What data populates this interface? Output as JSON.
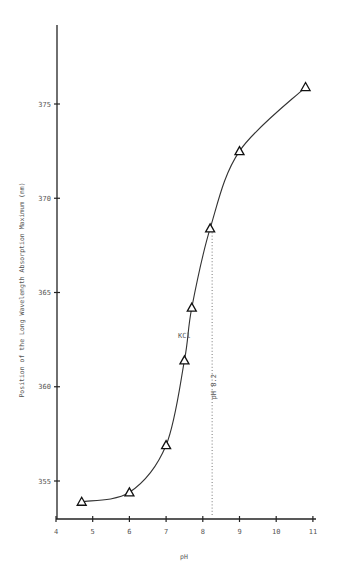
{
  "chart_data": {
    "type": "line",
    "title": "",
    "xlabel": "pH",
    "ylabel": "Position of the Long Wavelength Absorption Maximum (nm)",
    "xlim": [
      4,
      11
    ],
    "ylim": [
      353,
      378
    ],
    "x_ticks": [
      4,
      5,
      6,
      7,
      8,
      9,
      10,
      11
    ],
    "y_ticks": [
      355,
      360,
      365,
      370,
      375
    ],
    "grid": false,
    "legend": null,
    "series": [
      {
        "name": "absorption maximum",
        "marker": "triangle-open",
        "x": [
          4.7,
          6.0,
          7.0,
          7.5,
          7.7,
          8.2,
          9.0,
          10.8
        ],
        "y": [
          353.9,
          354.4,
          356.9,
          361.4,
          364.2,
          368.4,
          372.5,
          375.9
        ]
      }
    ],
    "annotations": [
      {
        "text": "KCl",
        "x": 7.5,
        "y": 362.6
      },
      {
        "text": "pH 8.2",
        "x": 8.35,
        "y": 360,
        "rotated": true
      },
      {
        "type": "dotted-vertical-line",
        "x": 8.2,
        "y_from": 353,
        "y_to": 368.4
      }
    ]
  }
}
